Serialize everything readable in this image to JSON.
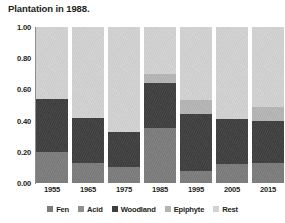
{
  "caption": "Plantation in 1988.",
  "colors": {
    "fen": "#7c7c7c",
    "acid": "#8f8f8f",
    "woodland": "#3f3f3f",
    "epiphyte": "#b5b5b5",
    "rest": "#d2d2d2",
    "axis": "#8d8d8d",
    "text": "#231f20",
    "background": "#ffffff"
  },
  "legend": {
    "position": "bottom",
    "items": [
      {
        "label": "Fen",
        "color": "#7c7c7c",
        "swatch": "square-swatch"
      },
      {
        "label": "Acid",
        "color": "#8f8f8f",
        "swatch": "square-swatch"
      },
      {
        "label": "Woodland",
        "color": "#3f3f3f",
        "swatch": "square-swatch"
      },
      {
        "label": "Epiphyte",
        "color": "#b5b5b5",
        "swatch": "square-swatch"
      },
      {
        "label": "Rest",
        "color": "#d2d2d2",
        "swatch": "square-swatch"
      }
    ]
  },
  "yaxis": {
    "ticks": [
      "1.00",
      "0.80",
      "0.60",
      "0.40",
      "0.20",
      "0.00"
    ],
    "values": [
      1.0,
      0.8,
      0.6,
      0.4,
      0.2,
      0.0
    ],
    "min": 0.0,
    "max": 1.0
  },
  "xaxis": {
    "ticks": [
      "1955",
      "1965",
      "1975",
      "1985",
      "1995",
      "2005",
      "2015"
    ]
  },
  "chart_data": {
    "type": "bar",
    "subtype": "stacked-proportional",
    "title": "Plantation in 1988.",
    "xlabel": "",
    "ylabel": "",
    "ylim": [
      0.0,
      1.0
    ],
    "grid": false,
    "legend_position": "bottom",
    "categories": [
      "1955",
      "1965",
      "1975",
      "1985",
      "1995",
      "2005",
      "2015"
    ],
    "series": [
      {
        "name": "Fen",
        "color": "#7c7c7c",
        "values": [
          0.2,
          0.13,
          0.1,
          0.35,
          0.08,
          0.12,
          0.13
        ]
      },
      {
        "name": "Acid",
        "color": "#8f8f8f",
        "values": [
          0.0,
          0.0,
          0.0,
          0.0,
          0.0,
          0.0,
          0.0
        ]
      },
      {
        "name": "Woodland",
        "color": "#3f3f3f",
        "values": [
          0.34,
          0.29,
          0.23,
          0.29,
          0.36,
          0.29,
          0.27
        ]
      },
      {
        "name": "Epiphyte",
        "color": "#b5b5b5",
        "values": [
          0.0,
          0.0,
          0.0,
          0.06,
          0.09,
          0.0,
          0.09
        ]
      },
      {
        "name": "Rest",
        "color": "#d2d2d2",
        "values": [
          0.46,
          0.58,
          0.67,
          0.3,
          0.47,
          0.59,
          0.51
        ]
      }
    ],
    "bars": [
      {
        "category": "1955",
        "segments": [
          {
            "name": "Fen",
            "value": 0.2,
            "color": "#7c7c7c"
          },
          {
            "name": "Woodland",
            "value": 0.34,
            "color": "#3f3f3f"
          },
          {
            "name": "Rest",
            "value": 0.46,
            "color": "#d2d2d2"
          }
        ]
      },
      {
        "category": "1965",
        "segments": [
          {
            "name": "Fen",
            "value": 0.13,
            "color": "#7c7c7c"
          },
          {
            "name": "Woodland",
            "value": 0.29,
            "color": "#3f3f3f"
          },
          {
            "name": "Rest",
            "value": 0.58,
            "color": "#d2d2d2"
          }
        ]
      },
      {
        "category": "1975",
        "segments": [
          {
            "name": "Fen",
            "value": 0.1,
            "color": "#7c7c7c"
          },
          {
            "name": "Woodland",
            "value": 0.23,
            "color": "#3f3f3f"
          },
          {
            "name": "Rest",
            "value": 0.67,
            "color": "#d2d2d2"
          }
        ]
      },
      {
        "category": "1985",
        "segments": [
          {
            "name": "Fen",
            "value": 0.35,
            "color": "#7c7c7c"
          },
          {
            "name": "Woodland",
            "value": 0.29,
            "color": "#3f3f3f"
          },
          {
            "name": "Epiphyte",
            "value": 0.06,
            "color": "#b5b5b5"
          },
          {
            "name": "Rest",
            "value": 0.3,
            "color": "#d2d2d2"
          }
        ]
      },
      {
        "category": "1995",
        "segments": [
          {
            "name": "Fen",
            "value": 0.08,
            "color": "#7c7c7c"
          },
          {
            "name": "Woodland",
            "value": 0.36,
            "color": "#3f3f3f"
          },
          {
            "name": "Epiphyte",
            "value": 0.09,
            "color": "#b5b5b5"
          },
          {
            "name": "Rest",
            "value": 0.47,
            "color": "#d2d2d2"
          }
        ]
      },
      {
        "category": "2005",
        "segments": [
          {
            "name": "Fen",
            "value": 0.12,
            "color": "#7c7c7c"
          },
          {
            "name": "Woodland",
            "value": 0.29,
            "color": "#3f3f3f"
          },
          {
            "name": "Rest",
            "value": 0.59,
            "color": "#d2d2d2"
          }
        ]
      },
      {
        "category": "2015",
        "segments": [
          {
            "name": "Fen",
            "value": 0.13,
            "color": "#7c7c7c"
          },
          {
            "name": "Woodland",
            "value": 0.27,
            "color": "#3f3f3f"
          },
          {
            "name": "Epiphyte",
            "value": 0.09,
            "color": "#b5b5b5"
          },
          {
            "name": "Rest",
            "value": 0.51,
            "color": "#d2d2d2"
          }
        ]
      }
    ]
  }
}
